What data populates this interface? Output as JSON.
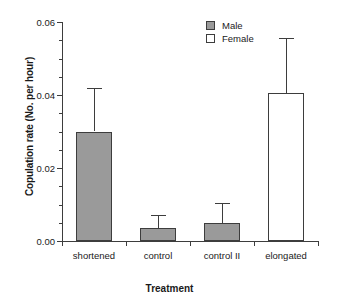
{
  "chart_data": {
    "type": "bar",
    "title": "",
    "xlabel": "Treatment",
    "ylabel": "Copulation rate (No. per hour)",
    "categories": [
      "shortened",
      "control",
      "control II",
      "elongated"
    ],
    "ylim": [
      0.0,
      0.06
    ],
    "ytick_labels": [
      "0.00",
      "0.02",
      "0.04",
      "0.06"
    ],
    "ytick_values": [
      0.0,
      0.02,
      0.04,
      0.06
    ],
    "yminor_values": [
      0.005,
      0.01,
      0.015,
      0.025,
      0.03,
      0.035,
      0.045,
      0.05,
      0.055
    ],
    "grid": false,
    "legend_position": "top-right",
    "legend": [
      {
        "name": "Male",
        "color": "#9a9a9a"
      },
      {
        "name": "Female",
        "color": "#ffffff"
      }
    ],
    "bars": [
      {
        "category": "shortened",
        "group": "Male",
        "value": 0.03,
        "error_high": 0.042,
        "color": "#9a9a9a"
      },
      {
        "category": "control",
        "group": "Male",
        "value": 0.0035,
        "error_high": 0.007,
        "color": "#9a9a9a"
      },
      {
        "category": "control II",
        "group": "Male",
        "value": 0.005,
        "error_high": 0.0105,
        "color": "#9a9a9a"
      },
      {
        "category": "elongated",
        "group": "Female",
        "value": 0.0405,
        "error_high": 0.0555,
        "color": "#ffffff"
      }
    ],
    "values": [
      0.03,
      0.0035,
      0.005,
      0.0405
    ],
    "errors_high": [
      0.042,
      0.007,
      0.0105,
      0.0555
    ]
  },
  "axis": {
    "y_title": "Copulation rate (No. per hour)",
    "x_title": "Treatment"
  }
}
